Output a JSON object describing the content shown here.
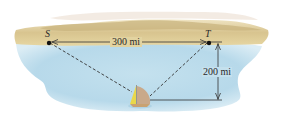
{
  "diagram": {
    "points": [
      {
        "id": "S",
        "label": "S"
      },
      {
        "id": "T",
        "label": "T"
      }
    ],
    "dimensions": {
      "horizontal": "300 mi",
      "vertical": "200 mi"
    },
    "colors": {
      "sky": "#ffffff",
      "land_light": "#e8d9a8",
      "land_dark": "#c9b27a",
      "water_light": "#d8ecf5",
      "water": "#bcdcec",
      "line": "#333333",
      "sail_yellow": "#e9d84a",
      "sail_tan": "#c9a98a"
    }
  }
}
